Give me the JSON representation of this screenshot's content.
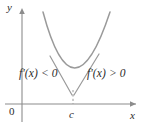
{
  "figure": {
    "kind": "calculus-increasing-decreasing-diagram",
    "background_color": "#ffffff",
    "axes": {
      "x_axis_label": "x",
      "y_axis_label": "y",
      "origin_label": "0",
      "axis_color": "#8c8c8c",
      "label_color": "#2b2b2b"
    },
    "annotations": {
      "left_label": "f'(x) < 0",
      "right_label": "f'(x) > 0",
      "critical_point_label": "c"
    },
    "curve": {
      "type": "parabola",
      "color": "#9a9a9a",
      "description": "upward-opening parabola with minimum at x = c",
      "vertex_x": 73,
      "vertex_y": 88,
      "left_top_x": 43,
      "right_top_x": 110,
      "top_y": 12
    },
    "tangents": {
      "color": "#9a9a9a",
      "left": {
        "slope_sign": "negative",
        "description": "tangent line with negative slope left of c"
      },
      "right": {
        "slope_sign": "positive",
        "description": "tangent line with positive slope right of c"
      }
    },
    "dashed_line": {
      "color": "#9a9a9a",
      "description": "dashed vertical segment from vertex down to x-axis at c"
    }
  }
}
